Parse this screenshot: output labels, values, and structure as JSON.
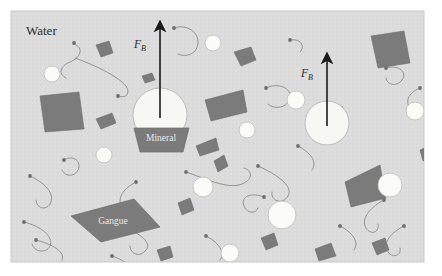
{
  "figure": {
    "title_label": "Water",
    "domain_kind": "froth-flotation-schematic",
    "canvas": {
      "width": 442,
      "height": 276
    },
    "water_box": {
      "x": 11,
      "y": 11,
      "width": 413,
      "height": 251,
      "fill": "#dcdcdc",
      "stroke": "#c9c9c9"
    },
    "colors": {
      "water": "#dcdcdc",
      "bubble": "#f7f7f4",
      "bubble_stroke": "#bdbdbd",
      "small_circle": "#fbfbf8",
      "small_circle_stroke": "#c2c2c2",
      "particle_dark": "#7b7b7b",
      "particle_dark_stroke": "#6d6d6d",
      "surfactant": "#8a8a8a",
      "arrow": "#1a1a1a",
      "label_text": "#2b2b2b",
      "particle_label_text": "#e8e8e8"
    }
  },
  "labels": {
    "water": "Water",
    "mineral": "Mineral",
    "gangue": "Gangue",
    "buoyancy_left": {
      "symbol": "F",
      "subscript": "B"
    },
    "buoyancy_right": {
      "symbol": "F",
      "subscript": "B"
    }
  },
  "bubbles": [
    {
      "name": "mineral-laden-bubble-left",
      "cx": 160,
      "cy": 115,
      "r": 27
    },
    {
      "name": "mineral-laden-bubble-right",
      "cx": 327,
      "cy": 123,
      "r": 22
    }
  ],
  "arrows": [
    {
      "name": "buoyancy-arrow-left",
      "x": 160,
      "y_tail": 118,
      "y_head": 26,
      "label_x": 146,
      "label_y": 48
    },
    {
      "name": "buoyancy-arrow-right",
      "x": 327,
      "y_tail": 126,
      "y_head": 58,
      "label_x": 313,
      "label_y": 77
    }
  ],
  "free_bubbles": [
    {
      "cx": 52,
      "cy": 74,
      "r": 8
    },
    {
      "cx": 104,
      "cy": 155,
      "r": 8
    },
    {
      "cx": 213,
      "cy": 43,
      "r": 8
    },
    {
      "cx": 247,
      "cy": 130,
      "r": 8
    },
    {
      "cx": 203,
      "cy": 187,
      "r": 10
    },
    {
      "cx": 282,
      "cy": 215,
      "r": 14
    },
    {
      "cx": 390,
      "cy": 185,
      "r": 12
    },
    {
      "cx": 415,
      "cy": 111,
      "r": 9
    },
    {
      "cx": 230,
      "cy": 253,
      "r": 9
    },
    {
      "cx": 296,
      "cy": 100,
      "r": 9
    }
  ],
  "mineral_particles": [
    {
      "name": "mineral-attached-left",
      "points": "134,128 189,128 183,152 140,152",
      "label": "Mineral",
      "label_x": 161,
      "label_y": 141
    },
    {
      "name": "gangue-rhombus",
      "points": "71,216 134,199 160,227 101,242",
      "label": "Gangue",
      "label_x": 113,
      "label_y": 224
    }
  ],
  "dark_fragments": [
    {
      "points": "40,96 79,92 84,129 45,132"
    },
    {
      "points": "205,100 243,90 247,112 211,121"
    },
    {
      "points": "371,36 404,31 410,63 378,68"
    },
    {
      "points": "345,182 380,165 386,198 351,207"
    },
    {
      "points": "96,119 112,113 116,123 101,129"
    },
    {
      "points": "234,52 251,47 256,60 241,66"
    },
    {
      "points": "196,146 216,138 219,150 200,156"
    },
    {
      "points": "214,161 224,155 228,166 218,172"
    },
    {
      "points": "178,203 190,198 194,210 182,215"
    },
    {
      "points": "142,76 152,73 155,80 145,83"
    },
    {
      "points": "261,238 274,233 278,245 266,250"
    },
    {
      "points": "315,249 331,243 336,256 319,261"
    },
    {
      "points": "372,243 385,238 389,250 377,255"
    },
    {
      "points": "420,150 429,146 432,157 423,161"
    },
    {
      "points": "157,250 170,246 173,257 161,261"
    },
    {
      "points": "314,110 324,104 330,113 320,119"
    },
    {
      "points": "330,112 342,106 347,117 336,122"
    },
    {
      "points": "317,121 339,121 343,138 323,142"
    },
    {
      "points": "96,45 109,41 113,53 101,57"
    }
  ],
  "surfactants": [
    {
      "path": "M 74,44 C 85,48 80,58 70,62 C 60,66 58,74 66,78",
      "head": {
        "cx": 74,
        "cy": 43
      }
    },
    {
      "path": "M 75,58 C 92,64 118,76 126,86 C 131,93 126,99 119,96",
      "head": {
        "cx": 118,
        "cy": 96
      }
    },
    {
      "path": "M 174,28 C 184,24 198,30 198,42 C 198,54 186,58 178,54",
      "head": {
        "cx": 174,
        "cy": 28
      }
    },
    {
      "path": "M 290,40 C 300,38 306,46 300,52",
      "head": {
        "cx": 290,
        "cy": 40
      }
    },
    {
      "path": "M 266,88 C 278,82 292,88 290,98 C 288,108 274,110 268,104",
      "head": {
        "cx": 266,
        "cy": 88
      }
    },
    {
      "path": "M 386,68 C 398,64 408,72 402,80 C 396,88 386,84 386,78",
      "head": {
        "cx": 386,
        "cy": 68
      }
    },
    {
      "path": "M 64,160 C 74,154 82,162 78,170 C 74,178 64,176 62,170",
      "head": {
        "cx": 64,
        "cy": 160
      }
    },
    {
      "path": "M 30,176 C 44,182 56,194 50,204 C 46,211 36,208 36,200",
      "head": {
        "cx": 30,
        "cy": 176
      }
    },
    {
      "path": "M 24,222 C 40,226 54,236 50,246 C 46,254 34,252 32,244",
      "head": {
        "cx": 24,
        "cy": 222
      }
    },
    {
      "path": "M 186,172 C 204,178 228,190 242,184 C 254,179 252,170 244,168",
      "head": {
        "cx": 186,
        "cy": 172
      }
    },
    {
      "path": "M 36,240 C 52,244 66,252 62,260",
      "head": {
        "cx": 36,
        "cy": 240
      }
    },
    {
      "path": "M 126,228 C 140,234 152,242 146,250 C 140,258 130,254 130,246",
      "head": {
        "cx": 126,
        "cy": 228
      }
    },
    {
      "path": "M 258,166 C 276,174 294,186 288,196 C 282,206 270,200 272,192",
      "head": {
        "cx": 258,
        "cy": 166
      }
    },
    {
      "path": "M 264,197 C 252,192 240,196 244,206 C 247,214 256,214 258,208",
      "head": {
        "cx": 264,
        "cy": 197
      }
    },
    {
      "path": "M 384,200 C 372,206 360,218 366,228 C 371,236 380,232 378,224",
      "head": {
        "cx": 384,
        "cy": 200
      }
    },
    {
      "path": "M 340,226 C 352,232 360,242 354,250",
      "head": {
        "cx": 340,
        "cy": 226
      }
    },
    {
      "path": "M 404,226 C 392,232 382,242 388,252 C 393,259 402,255 400,248",
      "head": {
        "cx": 404,
        "cy": 226
      }
    },
    {
      "path": "M 112,256 C 124,260 132,266 128,272",
      "head": {
        "cx": 112,
        "cy": 256
      }
    },
    {
      "path": "M 206,236 C 218,242 226,252 220,260",
      "head": {
        "cx": 206,
        "cy": 236
      }
    },
    {
      "path": "M 298,146 C 310,152 318,162 312,170",
      "head": {
        "cx": 298,
        "cy": 146
      }
    },
    {
      "path": "M 136,182 C 124,188 116,198 122,208",
      "head": {
        "cx": 136,
        "cy": 182
      }
    },
    {
      "path": "M 420,88 C 410,92 404,100 410,108",
      "head": {
        "cx": 420,
        "cy": 88
      }
    }
  ]
}
